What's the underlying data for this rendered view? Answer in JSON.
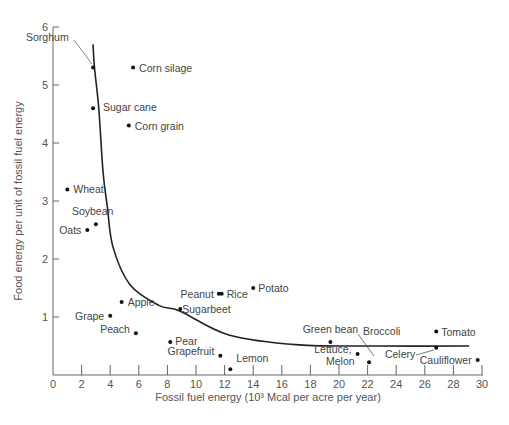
{
  "chart_data": {
    "type": "scatter",
    "title": "",
    "xlabel": "Fossil fuel energy (10³ Mcal per acre per year)",
    "ylabel": "Food energy per unit of fossil fuel energy",
    "xlim": [
      0,
      30
    ],
    "ylim": [
      0,
      6
    ],
    "xticks": [
      0,
      2,
      4,
      6,
      8,
      10,
      12,
      14,
      16,
      18,
      20,
      22,
      24,
      26,
      28,
      30
    ],
    "yticks": [
      1,
      2,
      3,
      4,
      5,
      6
    ],
    "grid": false,
    "legend": null,
    "points": [
      {
        "label": "Sorghum",
        "x": 2.8,
        "y": 5.3
      },
      {
        "label": "Corn silage",
        "x": 5.6,
        "y": 5.3
      },
      {
        "label": "Sugar cane",
        "x": 2.8,
        "y": 4.6
      },
      {
        "label": "Corn grain",
        "x": 5.3,
        "y": 4.3
      },
      {
        "label": "Wheat",
        "x": 1.0,
        "y": 3.2
      },
      {
        "label": "Soybean",
        "x": 3.0,
        "y": 2.6
      },
      {
        "label": "Oats",
        "x": 2.4,
        "y": 2.5
      },
      {
        "label": "Potato",
        "x": 14.0,
        "y": 1.5
      },
      {
        "label": "Peanut",
        "x": 11.6,
        "y": 1.4
      },
      {
        "label": "Rice",
        "x": 11.8,
        "y": 1.4
      },
      {
        "label": "Apple",
        "x": 4.8,
        "y": 1.26
      },
      {
        "label": "Sugarbeet",
        "x": 8.9,
        "y": 1.14
      },
      {
        "label": "Grape",
        "x": 4.0,
        "y": 1.02
      },
      {
        "label": "Peach",
        "x": 5.8,
        "y": 0.72
      },
      {
        "label": "Pear",
        "x": 8.2,
        "y": 0.57
      },
      {
        "label": "Grapefruit",
        "x": 11.7,
        "y": 0.33
      },
      {
        "label": "Lemon",
        "x": 12.4,
        "y": 0.1
      },
      {
        "label": "Green bean",
        "x": 19.4,
        "y": 0.57
      },
      {
        "label": "Lettuce, Melon",
        "x": 21.3,
        "y": 0.36
      },
      {
        "label": "Broccoli",
        "x": 22.1,
        "y": 0.22
      },
      {
        "label": "Tomato",
        "x": 26.8,
        "y": 0.75
      },
      {
        "label": "Celery",
        "x": 26.8,
        "y": 0.47
      },
      {
        "label": "Cauliflower",
        "x": 29.7,
        "y": 0.26
      }
    ],
    "curve": {
      "description": "Hyperbolic trend line",
      "x": [
        2.8,
        2.9,
        3.2,
        3.5,
        3.8,
        4.2,
        5.4,
        7.4,
        8.9,
        12.3,
        17.2,
        22.7,
        29.1
      ],
      "y": [
        5.7,
        5.3,
        4.6,
        3.5,
        2.9,
        2.2,
        1.55,
        1.2,
        1.1,
        0.69,
        0.52,
        0.5,
        0.5
      ]
    }
  },
  "axes": {
    "x_title": "Fossil fuel energy (10³ Mcal per acre per year)",
    "y_title": "Food energy per unit of fossil fuel energy"
  }
}
